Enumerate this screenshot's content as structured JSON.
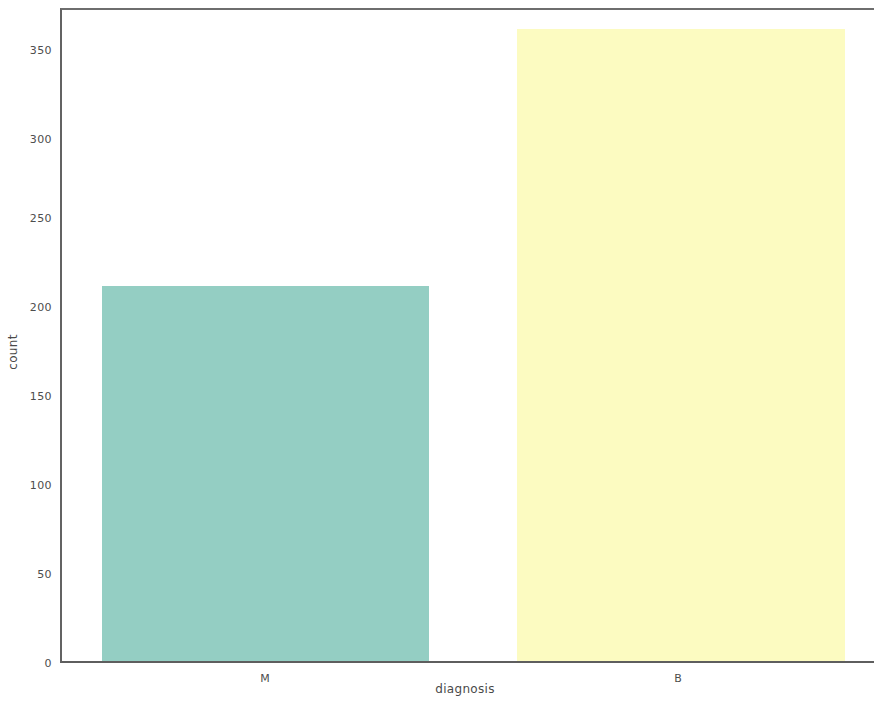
{
  "chart_data": {
    "type": "bar",
    "title": "",
    "subtitle": "",
    "xlabel": "diagnosis",
    "ylabel": "count",
    "categories": [
      "M",
      "B"
    ],
    "values": [
      212,
      357
    ],
    "colors": [
      "#94cec3",
      "#fcfbc1"
    ],
    "ylim": [
      0,
      368
    ],
    "yticks": [
      0,
      50,
      100,
      150,
      200,
      250,
      300,
      350
    ],
    "ytick_labels": [
      "0",
      "50",
      "100",
      "150",
      "200",
      "250",
      "300",
      "350"
    ],
    "xtick_labels": [
      "M",
      "B"
    ],
    "grid": false,
    "legend": null,
    "annotations": [],
    "axis_color": "#636363",
    "background": "#ffffff"
  }
}
